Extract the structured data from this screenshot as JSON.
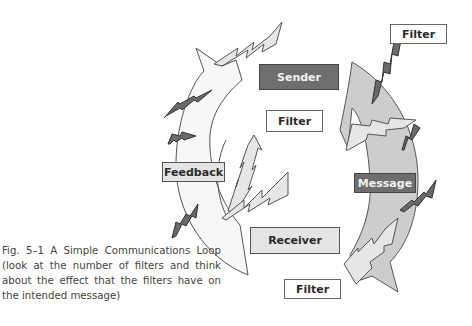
{
  "figure": {
    "boxes": {
      "sender": "Sender",
      "message": "Message",
      "receiver": "Receiver",
      "feedback": "Feedback",
      "filter_top_right": "Filter",
      "filter_middle": "Filter",
      "filter_bottom": "Filter"
    },
    "caption": "Fig. 5–1 A Simple Communications Loop (look at the number of filters and think about the effect that the filters have on the intended message)",
    "colors": {
      "dark_box": "#6e6e6e",
      "light_box": "#e4e4e4",
      "feedback_arrow": "#f7f7f7",
      "message_arrow": "#cdcdcd",
      "light_bolt": "#e6e6e6",
      "dark_bolt": "#6a6a6a"
    }
  }
}
